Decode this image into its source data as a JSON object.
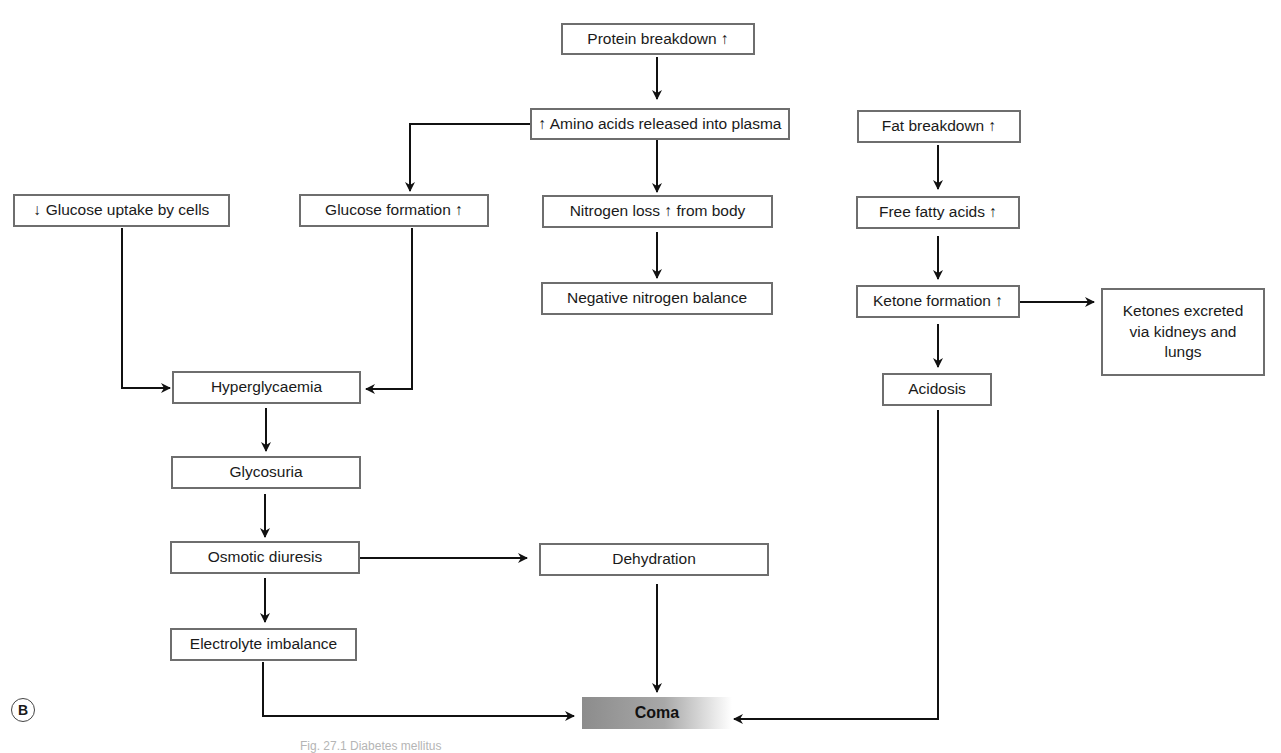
{
  "figure": {
    "panel_label": "B",
    "caption": "Fig. 27.1 Diabetes mellitus",
    "accent_colors": {
      "box_border": "#6e6e6e",
      "arrow": "#111111",
      "coma_fill": "#9a9a9a"
    }
  },
  "nodes": {
    "protein_breakdown": "Protein breakdown ↑",
    "amino_acids": "↑ Amino acids released into plasma",
    "fat_breakdown": "Fat breakdown ↑",
    "glucose_uptake": "↓ Glucose uptake by cells",
    "glucose_formation": "Glucose formation ↑",
    "nitrogen_loss": "Nitrogen loss ↑ from body",
    "free_fatty_acids": "Free fatty acids ↑",
    "negative_nitrogen": "Negative nitrogen balance",
    "ketone_formation": "Ketone formation ↑",
    "ketones_excreted": "Ketones excreted via kidneys and lungs",
    "hyperglycaemia": "Hyperglycaemia",
    "acidosis": "Acidosis",
    "glycosuria": "Glycosuria",
    "osmotic_diuresis": "Osmotic diuresis",
    "dehydration": "Dehydration",
    "electrolyte_imbalance": "Electrolyte imbalance",
    "coma": "Coma"
  },
  "edges": [
    {
      "from": "protein_breakdown",
      "to": "amino_acids"
    },
    {
      "from": "amino_acids",
      "to": "glucose_formation"
    },
    {
      "from": "amino_acids",
      "to": "nitrogen_loss"
    },
    {
      "from": "nitrogen_loss",
      "to": "negative_nitrogen"
    },
    {
      "from": "fat_breakdown",
      "to": "free_fatty_acids"
    },
    {
      "from": "free_fatty_acids",
      "to": "ketone_formation"
    },
    {
      "from": "ketone_formation",
      "to": "ketones_excreted"
    },
    {
      "from": "ketone_formation",
      "to": "acidosis"
    },
    {
      "from": "glucose_uptake",
      "to": "hyperglycaemia"
    },
    {
      "from": "glucose_formation",
      "to": "hyperglycaemia"
    },
    {
      "from": "hyperglycaemia",
      "to": "glycosuria"
    },
    {
      "from": "glycosuria",
      "to": "osmotic_diuresis"
    },
    {
      "from": "osmotic_diuresis",
      "to": "dehydration"
    },
    {
      "from": "osmotic_diuresis",
      "to": "electrolyte_imbalance"
    },
    {
      "from": "electrolyte_imbalance",
      "to": "coma"
    },
    {
      "from": "dehydration",
      "to": "coma"
    },
    {
      "from": "acidosis",
      "to": "coma"
    }
  ]
}
